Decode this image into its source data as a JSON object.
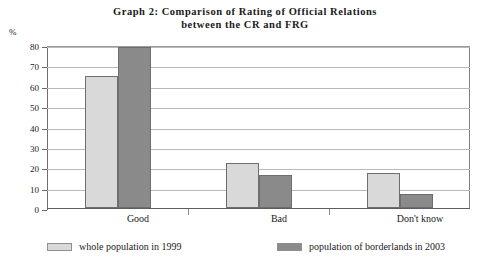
{
  "chart_data": {
    "type": "bar",
    "title": "Graph 2: Comparison of Rating of Official Relations between the CR and FRG",
    "title_lines": [
      "Graph 2: Comparison of Rating of Official Relations",
      "between the CR and FRG"
    ],
    "xlabel": "",
    "ylabel": "%",
    "ylim": [
      0,
      80
    ],
    "ytick_step": 10,
    "yticks": [
      80,
      70,
      60,
      50,
      40,
      30,
      20,
      10,
      0
    ],
    "ytick_labels": [
      "80",
      "70",
      "60",
      "50",
      "40",
      "30",
      "20",
      "10",
      "0"
    ],
    "categories": [
      "Good",
      "Bad",
      "Don't know"
    ],
    "grid": true,
    "grid_axis": "y",
    "legend_position": "bottom",
    "series": [
      {
        "name": "whole population in 1999",
        "color": "#d9d9d9",
        "values": [
          65,
          22,
          17
        ]
      },
      {
        "name": "population of borderlands in 2003",
        "color": "#8a8a8a",
        "values": [
          79,
          16,
          7
        ]
      }
    ]
  },
  "colors": {
    "series_light": "#d9d9d9",
    "series_dark": "#8a8a8a",
    "bar_outline": "#6e6e6e",
    "gridline": "#b9b9b9",
    "axis": "#6f6f6f",
    "text": "#1a1a1a",
    "background": "#ffffff"
  }
}
